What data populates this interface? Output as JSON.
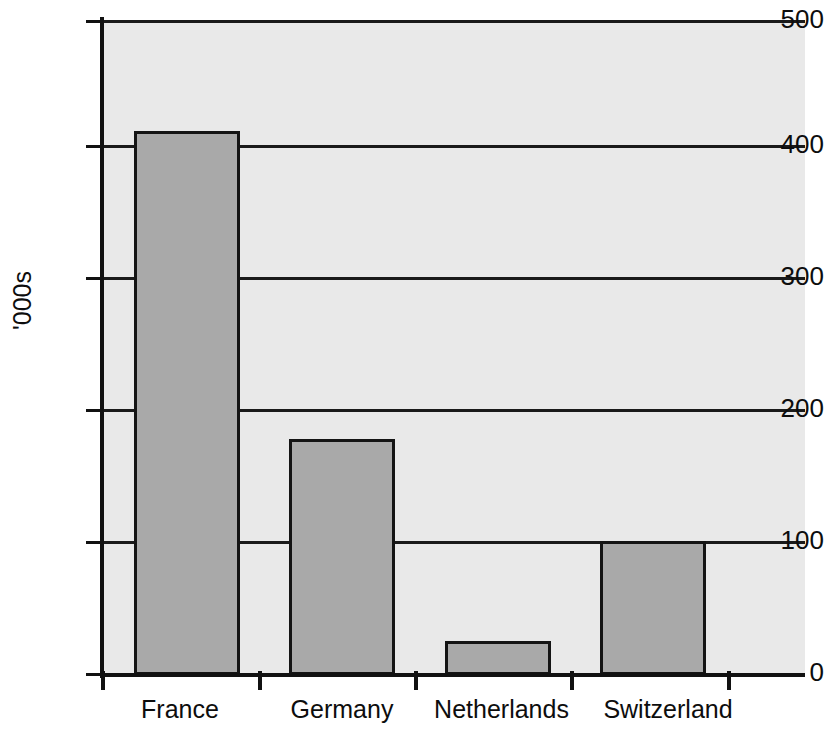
{
  "chart_data": {
    "type": "bar",
    "title": "",
    "subtitle": "",
    "xlabel": "",
    "ylabel": "'000s",
    "categories": [
      "France",
      "Germany",
      "Netherlands",
      "Switzerland"
    ],
    "values": [
      415,
      180,
      26,
      102
    ],
    "ylim": [
      0,
      500
    ],
    "y_ticks": [
      0,
      100,
      200,
      300,
      400,
      500
    ],
    "y_tick_labels": [
      "0",
      "100",
      "200",
      "300",
      "400",
      "500"
    ],
    "grid": "horizontal",
    "legend": "none",
    "series": [
      {
        "name": "",
        "values": [
          415,
          180,
          26,
          102
        ]
      }
    ],
    "colors": {
      "bar_fill": "#a9a9a9",
      "bar_border": "#141414",
      "plot_background": "#e9e9e9",
      "axis": "#111111",
      "gridline": "#1a1a1a",
      "text": "#0d0d0d",
      "page_background": "#ffffff"
    }
  }
}
